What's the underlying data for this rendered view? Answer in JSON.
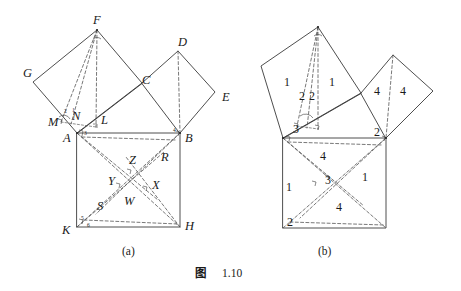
{
  "figure": {
    "caption_label": "图",
    "caption_number": "1.10",
    "panels": [
      {
        "id": "a",
        "label": "(a)"
      },
      {
        "id": "b",
        "label": "(b)"
      }
    ]
  },
  "panel_a": {
    "point_labels": [
      {
        "name": "F",
        "text": "F",
        "x": 93,
        "y": 24
      },
      {
        "name": "D",
        "text": "D",
        "x": 178,
        "y": 46
      },
      {
        "name": "G",
        "text": "G",
        "x": 23,
        "y": 77
      },
      {
        "name": "C",
        "text": "C",
        "x": 142,
        "y": 84
      },
      {
        "name": "E",
        "text": "E",
        "x": 222,
        "y": 101
      },
      {
        "name": "M",
        "text": "M",
        "x": 48,
        "y": 126
      },
      {
        "name": "N",
        "text": "N",
        "x": 72,
        "y": 120
      },
      {
        "name": "L",
        "text": "L",
        "x": 101,
        "y": 124
      },
      {
        "name": "A",
        "text": "A",
        "x": 63,
        "y": 142
      },
      {
        "name": "B",
        "text": "B",
        "x": 185,
        "y": 142
      },
      {
        "name": "R",
        "text": "R",
        "x": 161,
        "y": 161
      },
      {
        "name": "Z",
        "text": "Z",
        "x": 129,
        "y": 164
      },
      {
        "name": "Y",
        "text": "Y",
        "x": 108,
        "y": 185
      },
      {
        "name": "X",
        "text": "X",
        "x": 152,
        "y": 189
      },
      {
        "name": "W",
        "text": "W",
        "x": 124,
        "y": 205
      },
      {
        "name": "S",
        "text": "S",
        "x": 97,
        "y": 210
      },
      {
        "name": "K",
        "text": "K",
        "x": 62,
        "y": 234
      },
      {
        "name": "H",
        "text": "H",
        "x": 185,
        "y": 230
      }
    ],
    "angle_numbers": [
      {
        "name": "angle-2",
        "text": "2",
        "x": 64,
        "y": 113
      },
      {
        "name": "angle-1",
        "text": "1",
        "x": 72,
        "y": 112
      },
      {
        "name": "angle-3",
        "text": "3",
        "x": 84,
        "y": 135
      },
      {
        "name": "angle-4",
        "text": "4",
        "x": 173,
        "y": 132
      },
      {
        "name": "angle-5",
        "text": "5",
        "x": 81,
        "y": 220
      },
      {
        "name": "angle-6",
        "text": "6",
        "x": 87,
        "y": 227
      }
    ]
  },
  "panel_b": {
    "region_numbers": [
      {
        "name": "region-left-1a",
        "text": "1",
        "x": 284,
        "y": 86
      },
      {
        "name": "region-left-1b",
        "text": "1",
        "x": 329,
        "y": 86
      },
      {
        "name": "region-left-2a",
        "text": "2",
        "x": 303,
        "y": 100
      },
      {
        "name": "region-left-2b",
        "text": "2",
        "x": 312,
        "y": 100
      },
      {
        "name": "region-right-4a",
        "text": "4",
        "x": 377,
        "y": 95
      },
      {
        "name": "region-right-4b",
        "text": "4",
        "x": 403,
        "y": 95
      },
      {
        "name": "vertex-3-top",
        "text": "3",
        "x": 296,
        "y": 131
      },
      {
        "name": "vertex-2-top-right",
        "text": "2",
        "x": 379,
        "y": 133
      },
      {
        "name": "region-bottom-4-top",
        "text": "4",
        "x": 322,
        "y": 157
      },
      {
        "name": "region-bottom-1-right",
        "text": "1",
        "x": 364,
        "y": 178
      },
      {
        "name": "region-bottom-3-center",
        "text": "3",
        "x": 327,
        "y": 181
      },
      {
        "name": "region-bottom-1-left",
        "text": "1",
        "x": 288,
        "y": 188
      },
      {
        "name": "region-bottom-4-bottom",
        "text": "4",
        "x": 338,
        "y": 208
      },
      {
        "name": "vertex-2-bottom-left",
        "text": "2",
        "x": 289,
        "y": 224
      }
    ]
  },
  "geometry_a": {
    "square_ABHK": [
      [
        77,
        133
      ],
      [
        180,
        133
      ],
      [
        180,
        227
      ],
      [
        77,
        227
      ]
    ],
    "square_on_AC": [
      [
        77,
        133
      ],
      [
        33,
        82
      ],
      [
        97,
        30
      ],
      [
        142,
        83
      ]
    ],
    "square_on_CB": [
      [
        142,
        83
      ],
      [
        178,
        51
      ],
      [
        215,
        92
      ],
      [
        180,
        133
      ]
    ],
    "notes": "A=(77,133) B=(180,133) H=(180,227) K=(77,227); C on AB-hypotenuse side; F apex of left square; G left vertex; D top of right square; E right vertex"
  }
}
